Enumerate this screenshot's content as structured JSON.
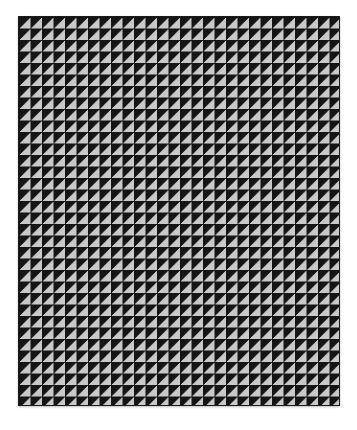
{
  "image": {
    "subject": "half-square triangle pattern blanket",
    "colors": {
      "dark": "#151515",
      "light": "#c9c9c9",
      "background": "#ffffff"
    },
    "grid": {
      "columns": 28,
      "rows": 34
    }
  }
}
